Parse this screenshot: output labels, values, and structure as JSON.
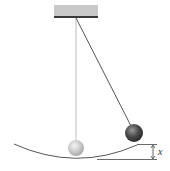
{
  "diagram": {
    "type": "physics-pendulum",
    "labels": {
      "height": "x"
    },
    "colors": {
      "ceiling_fill": "#c8c8c8",
      "ceiling_edge": "#3a3a3a",
      "string_vertical": "#b8b8b8",
      "string_displaced": "#555555",
      "ball_rest": "#c9c9c9",
      "ball_displaced": "#4a4a4a",
      "arc": "#555555",
      "dimension": "#444444"
    },
    "elements": {
      "ceiling": "ceiling-support",
      "pendulum_rest": "pendulum-at-rest",
      "pendulum_displaced": "pendulum-displaced",
      "swing_arc": "swing-path-arc",
      "height_marker": "height-dimension"
    }
  }
}
